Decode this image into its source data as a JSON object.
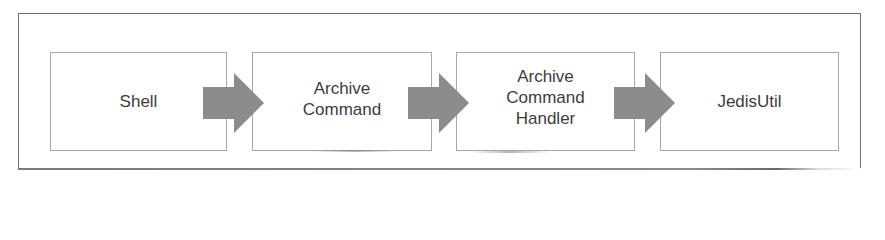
{
  "diagram": {
    "type": "flow",
    "direction": "left-to-right",
    "nodes": [
      {
        "id": "shell",
        "label": "Shell"
      },
      {
        "id": "archive-command",
        "label": "Archive\nCommand"
      },
      {
        "id": "archive-command-handler",
        "label": "Archive\nCommand\nHandler"
      },
      {
        "id": "jedis-util",
        "label": "JedisUtil"
      }
    ],
    "edges": [
      {
        "from": "shell",
        "to": "archive-command"
      },
      {
        "from": "archive-command",
        "to": "archive-command-handler"
      },
      {
        "from": "archive-command-handler",
        "to": "jedis-util"
      }
    ],
    "colors": {
      "arrow_fill": "#8c8c8c",
      "box_border": "#a8a8a8",
      "frame_border": "#6f6f6f",
      "text": "#3c3c3c",
      "background": "#ffffff"
    }
  }
}
